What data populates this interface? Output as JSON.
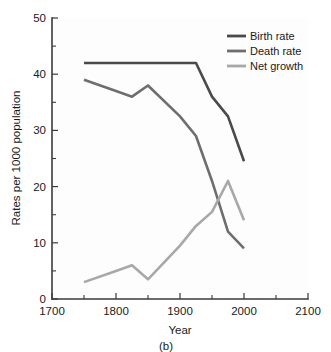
{
  "chart_data": {
    "type": "line",
    "title": "",
    "subtitle": "",
    "caption": "(b)",
    "xlabel": "Year",
    "ylabel": "Rates per 1000 population",
    "xlim": [
      1700,
      2100
    ],
    "ylim": [
      0,
      50
    ],
    "xticks": [
      1700,
      1800,
      1900,
      2000,
      2100
    ],
    "xticklabels": [
      "1700",
      "1800",
      "1900",
      "2000",
      "2100"
    ],
    "xminorticks": [
      1750,
      1850,
      1950,
      2050
    ],
    "yticks": [
      0,
      10,
      20,
      30,
      40,
      50
    ],
    "yticklabels": [
      "0",
      "10",
      "20",
      "30",
      "40",
      "50"
    ],
    "yminorticks": [
      5,
      15,
      25,
      35,
      45
    ],
    "grid": false,
    "legend_position": "top-right",
    "series": [
      {
        "name": "Birth rate",
        "color": "#4a4a4a",
        "x": [
          1750,
          1800,
          1825,
          1850,
          1900,
          1925,
          1950,
          1975,
          2000
        ],
        "values": [
          42,
          42,
          42,
          42,
          42,
          42,
          36,
          32.5,
          24.5
        ]
      },
      {
        "name": "Death rate",
        "color": "#6e6e6e",
        "x": [
          1750,
          1800,
          1825,
          1850,
          1900,
          1925,
          1950,
          1975,
          2000
        ],
        "values": [
          39,
          37,
          36,
          38,
          32.5,
          29,
          21,
          12,
          9
        ]
      },
      {
        "name": "Net growth",
        "color": "#a8a8a8",
        "x": [
          1750,
          1800,
          1825,
          1850,
          1900,
          1925,
          1950,
          1975,
          2000
        ],
        "values": [
          3,
          5,
          6,
          3.5,
          9.5,
          13,
          15.5,
          21,
          14
        ]
      }
    ]
  },
  "legend": {
    "items": [
      {
        "label": "Birth rate"
      },
      {
        "label": "Death rate"
      },
      {
        "label": "Net growth"
      }
    ]
  }
}
